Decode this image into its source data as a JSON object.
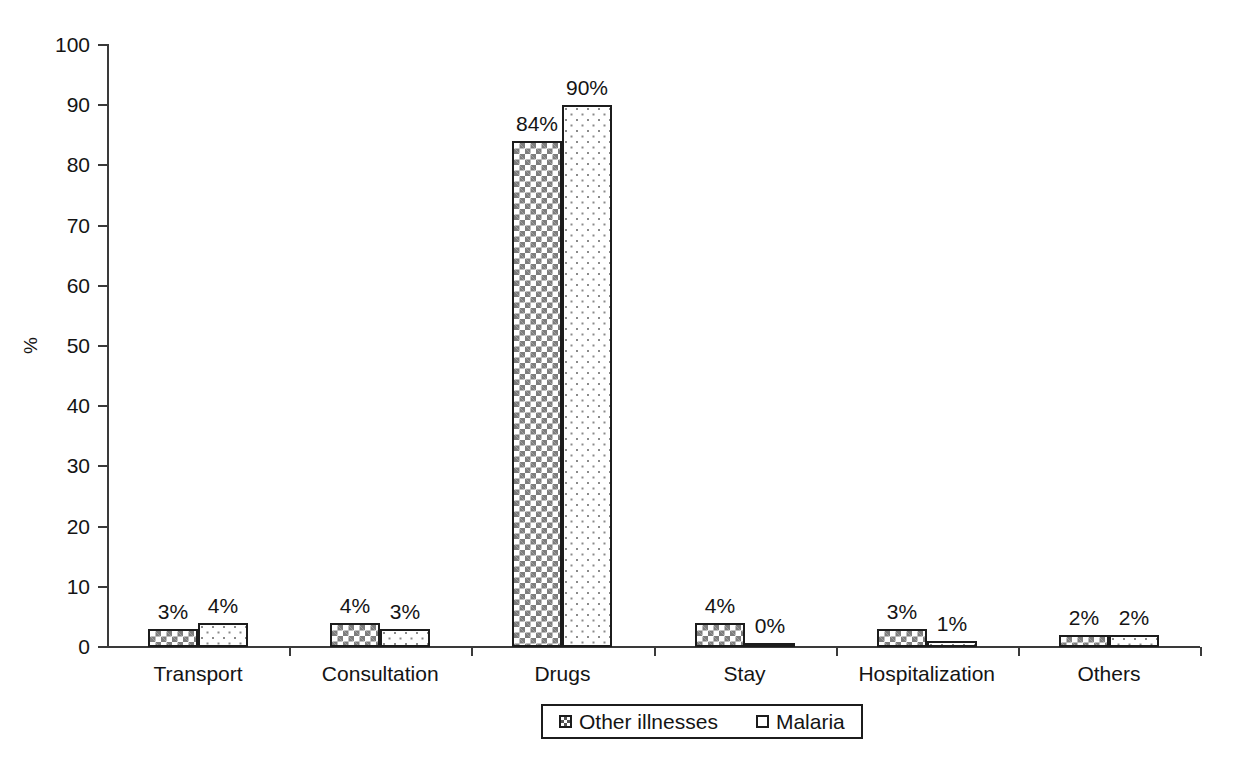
{
  "chart_data": {
    "type": "bar",
    "title": "",
    "xlabel": "",
    "ylabel": "%",
    "ylim": [
      0,
      100
    ],
    "yticks": [
      0,
      10,
      20,
      30,
      40,
      50,
      60,
      70,
      80,
      90,
      100
    ],
    "ytick_labels": [
      "0",
      "10",
      "20",
      "30",
      "40",
      "50",
      "60",
      "70",
      "80",
      "90",
      "100"
    ],
    "grid": false,
    "legend_position": "bottom-center",
    "categories": [
      "Transport",
      "Consultation",
      "Drugs",
      "Stay",
      "Hospitalization",
      "Others"
    ],
    "series": [
      {
        "name": "Other illnesses",
        "pattern": "checkerboard",
        "values": [
          3,
          4,
          84,
          4,
          3,
          2
        ],
        "data_labels": [
          "3%",
          "4%",
          "84%",
          "4%",
          "3%",
          "2%"
        ]
      },
      {
        "name": "Malaria",
        "pattern": "dots",
        "values": [
          4,
          3,
          90,
          0,
          1,
          2
        ],
        "data_labels": [
          "4%",
          "3%",
          "90%",
          "0%",
          "1%",
          "2%"
        ]
      }
    ]
  },
  "colors": {
    "axis": "#3a3a3a",
    "text": "#141414",
    "bar_outline": "#1c1c1c",
    "pattern_fill": "#7d7d7d",
    "background": "#ffffff"
  }
}
